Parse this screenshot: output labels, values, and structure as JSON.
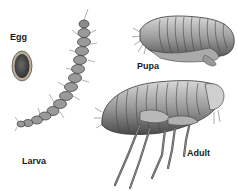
{
  "diagram": {
    "stages": [
      {
        "id": "egg",
        "label": "Egg"
      },
      {
        "id": "larva",
        "label": "Larva"
      },
      {
        "id": "pupa",
        "label": "Pupa"
      },
      {
        "id": "adult",
        "label": "Adult"
      }
    ],
    "colors": {
      "body_dark": "#3a3a3a",
      "body_mid": "#8a8a8a",
      "body_light": "#c8c8c8",
      "egg_fill": "#5a5a5a",
      "egg_rim": "#b0a890",
      "background": "#ffffff"
    }
  }
}
